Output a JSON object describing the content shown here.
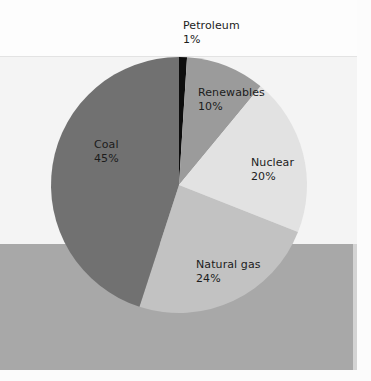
{
  "chart_data": {
    "type": "pie",
    "title": "",
    "subtitle": "",
    "xlabel": "",
    "ylabel": "",
    "legend_position": "none",
    "grid": false,
    "unit": "%",
    "total": 100,
    "start_angle_deg": 0,
    "direction": "clockwise",
    "categories": [
      "Petroleum",
      "Renewables",
      "Nuclear",
      "Natural gas",
      "Coal"
    ],
    "values": [
      1,
      10,
      20,
      24,
      45
    ],
    "slices": [
      {
        "label": "Petroleum",
        "value": 1,
        "value_text": "1%",
        "color": "#0d0d0d"
      },
      {
        "label": "Renewables",
        "value": 10,
        "value_text": "10%",
        "color": "#9b9b9b"
      },
      {
        "label": "Nuclear",
        "value": 20,
        "value_text": "20%",
        "color": "#e2e2e2"
      },
      {
        "label": "Natural gas",
        "value": 24,
        "value_text": "24%",
        "color": "#c2c2c2"
      },
      {
        "label": "Coal",
        "value": 45,
        "value_text": "45%",
        "color": "#717171"
      }
    ]
  },
  "labels": {
    "petroleum": {
      "name": "Petroleum",
      "value": "1%"
    },
    "renewables": {
      "name": "Renewables",
      "value": "10%"
    },
    "nuclear": {
      "name": "Nuclear",
      "value": "20%"
    },
    "natural_gas": {
      "name": "Natural gas",
      "value": "24%"
    },
    "coal": {
      "name": "Coal",
      "value": "45%"
    }
  },
  "geometry": {
    "center_x": 179,
    "center_y": 185,
    "radius": 128
  },
  "colors": {
    "background_top": "#fdfdfd",
    "background_field": "#f4f4f4",
    "background_band": "#a8a8a8",
    "rule": "#e3e3e3",
    "text": "#1c1c1c"
  }
}
